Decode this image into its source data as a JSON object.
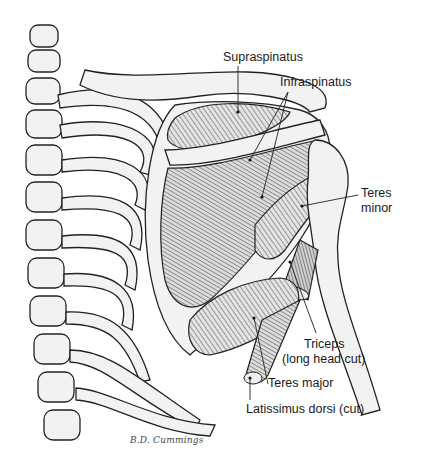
{
  "figure": {
    "signature": "B.D. Cummings",
    "labels": [
      {
        "id": "supraspinatus",
        "text": "Supraspinatus"
      },
      {
        "id": "infraspinatus",
        "text": "Infraspinatus"
      },
      {
        "id": "teres-minor-line1",
        "text": "Teres"
      },
      {
        "id": "teres-minor-line2",
        "text": "minor"
      },
      {
        "id": "triceps-line1",
        "text": "Triceps"
      },
      {
        "id": "triceps-line2",
        "text": "(long head cut)"
      },
      {
        "id": "teres-major",
        "text": "Teres major"
      },
      {
        "id": "latissimus-dorsi",
        "text": "Latissimus dorsi (cut)"
      }
    ]
  }
}
